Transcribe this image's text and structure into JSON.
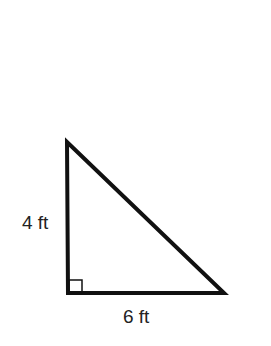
{
  "diagram": {
    "type": "right-triangle",
    "labels": {
      "vertical_leg": "4 ft",
      "horizontal_leg": "6 ft"
    },
    "right_angle_marker": true,
    "vertices": {
      "top": [
        67,
        142
      ],
      "bottom_left": [
        68,
        293
      ],
      "bottom_right": [
        224,
        293
      ]
    },
    "stroke_color": "#111111"
  }
}
